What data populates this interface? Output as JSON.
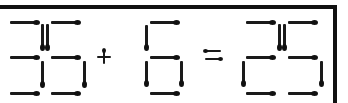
{
  "puzzle": {
    "equation": "35 + 6 = 25",
    "left_operand": "35",
    "operator": "+",
    "right_operand": "6",
    "relation": "=",
    "result": "25",
    "stick_color": "#1a1a1a",
    "frame_color": "#111111"
  }
}
